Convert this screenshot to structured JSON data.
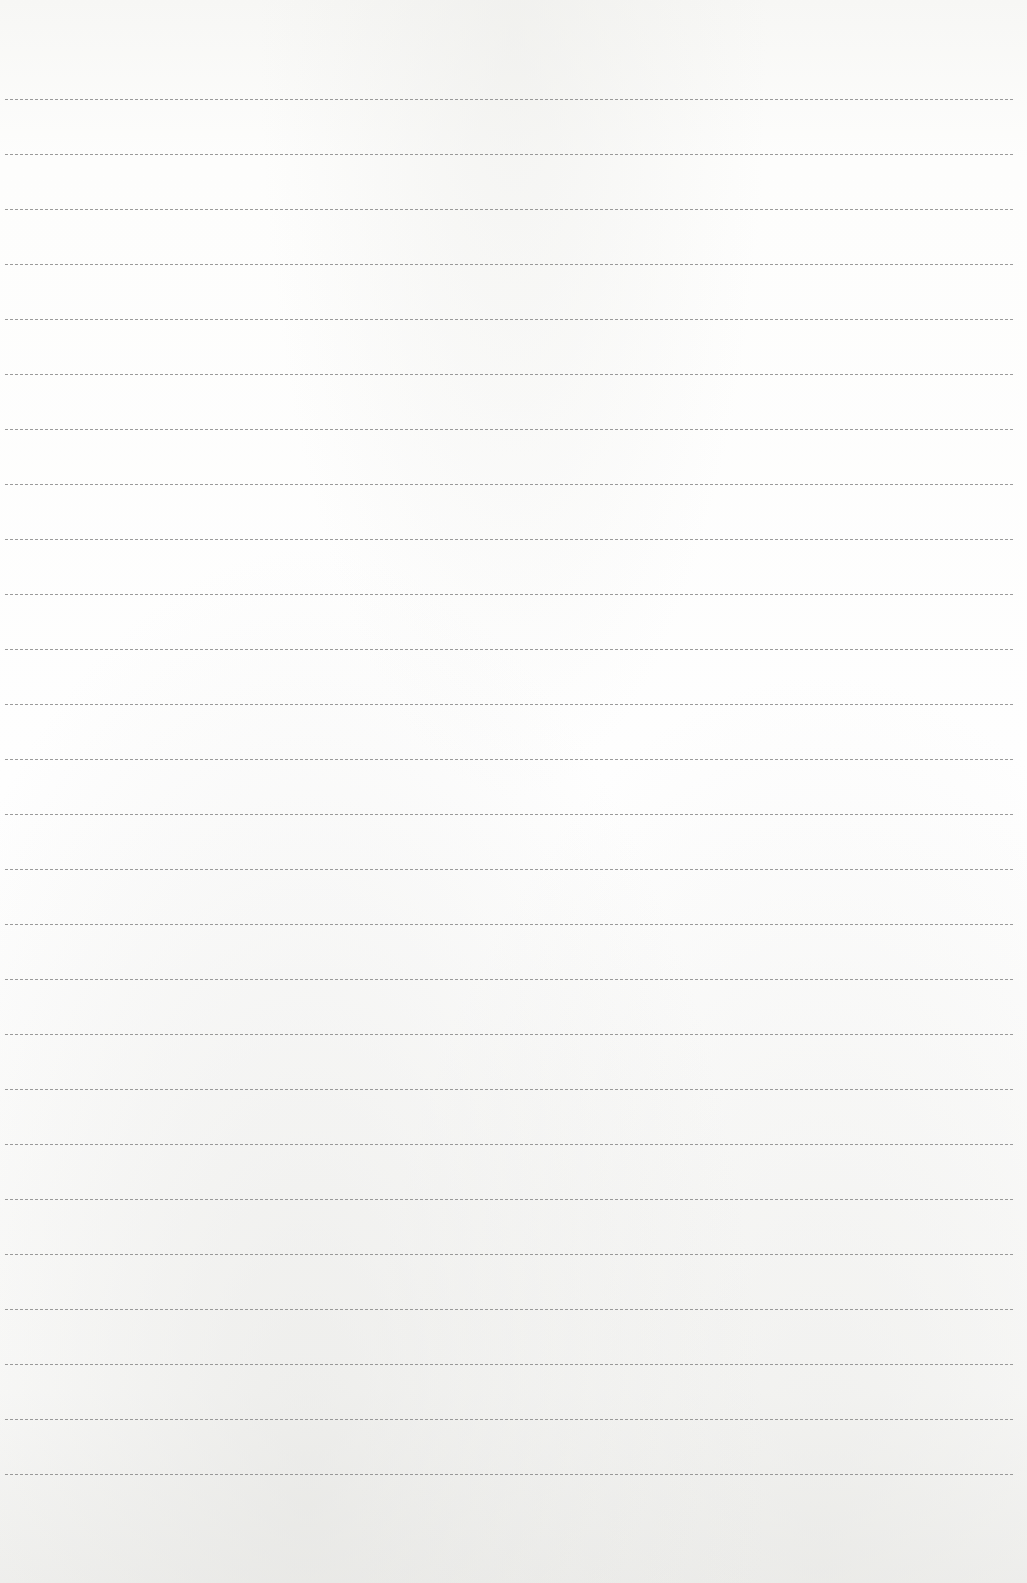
{
  "page": {
    "type": "lined-paper",
    "background_color": "#fbfbfa",
    "line_color": "#8a8a8a",
    "line_style": "dashed",
    "line_count": 26,
    "first_line_y": 99,
    "line_spacing": 55,
    "line_left": 5,
    "line_width": 1008
  },
  "lines": [
    {
      "text": ""
    },
    {
      "text": ""
    },
    {
      "text": ""
    },
    {
      "text": ""
    },
    {
      "text": ""
    },
    {
      "text": ""
    },
    {
      "text": ""
    },
    {
      "text": ""
    },
    {
      "text": ""
    },
    {
      "text": ""
    },
    {
      "text": ""
    },
    {
      "text": ""
    },
    {
      "text": ""
    },
    {
      "text": ""
    },
    {
      "text": ""
    },
    {
      "text": ""
    },
    {
      "text": ""
    },
    {
      "text": ""
    },
    {
      "text": ""
    },
    {
      "text": ""
    },
    {
      "text": ""
    },
    {
      "text": ""
    },
    {
      "text": ""
    },
    {
      "text": ""
    },
    {
      "text": ""
    },
    {
      "text": ""
    }
  ]
}
